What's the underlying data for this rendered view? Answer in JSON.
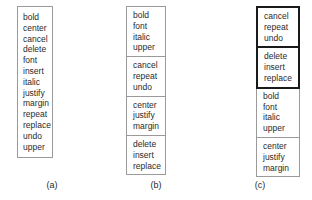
{
  "figure": {
    "panels": [
      {
        "id": "a",
        "caption": "(a)",
        "style": "ungrouped-flat-list",
        "groups": [
          {
            "emphasis": false,
            "items": [
              "bold",
              "center",
              "cancel",
              "delete",
              "font",
              "insert",
              "italic",
              "justify",
              "margin",
              "repeat",
              "replace",
              "undo",
              "upper"
            ]
          }
        ]
      },
      {
        "id": "b",
        "caption": "(b)",
        "style": "grouped-thin-separators",
        "groups": [
          {
            "emphasis": false,
            "items": [
              "bold",
              "font",
              "italic",
              "upper"
            ]
          },
          {
            "emphasis": false,
            "items": [
              "cancel",
              "repeat",
              "undo"
            ]
          },
          {
            "emphasis": false,
            "items": [
              "center",
              "justify",
              "margin"
            ]
          },
          {
            "emphasis": false,
            "items": [
              "delete",
              "insert",
              "replace"
            ]
          }
        ]
      },
      {
        "id": "c",
        "caption": "(c)",
        "style": "grouped-with-emphasis",
        "groups": [
          {
            "emphasis": true,
            "items": [
              "cancel",
              "repeat",
              "undo"
            ]
          },
          {
            "emphasis": true,
            "items": [
              "delete",
              "insert",
              "replace"
            ]
          },
          {
            "emphasis": false,
            "items": [
              "bold",
              "font",
              "italic",
              "upper"
            ]
          },
          {
            "emphasis": false,
            "items": [
              "center",
              "justify",
              "margin"
            ]
          }
        ]
      }
    ],
    "colors": {
      "box_border": "#9a9a9a",
      "emphasis_border": "#1a1a1a",
      "text": "#2a2a2a",
      "background": "#ffffff"
    }
  }
}
